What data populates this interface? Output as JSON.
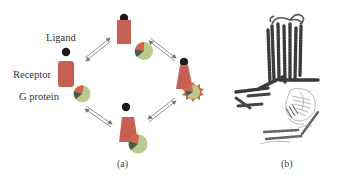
{
  "figure": {
    "panel_a": {
      "caption": "(a)",
      "labels": {
        "ligand": "Ligand",
        "receptor": "Receptor",
        "g_protein": "G protein"
      },
      "states": [
        {
          "id": "inactive",
          "position": "left",
          "receptor_shape": "rounded-rect",
          "g_protein": "separated"
        },
        {
          "id": "ligand-bound",
          "position": "top",
          "receptor_shape": "rect",
          "g_protein": "separated"
        },
        {
          "id": "active-coupled",
          "position": "right",
          "receptor_shape": "trapezoid",
          "g_protein": "coupled-activated"
        },
        {
          "id": "pre-coupled",
          "position": "bottom",
          "receptor_shape": "trapezoid",
          "g_protein": "coupled"
        }
      ],
      "transitions": [
        {
          "from": "inactive",
          "to": "ligand-bound",
          "type": "reversible"
        },
        {
          "from": "ligand-bound",
          "to": "active-coupled",
          "type": "reversible"
        },
        {
          "from": "active-coupled",
          "to": "pre-coupled",
          "type": "reversible"
        },
        {
          "from": "pre-coupled",
          "to": "inactive",
          "type": "reversible"
        }
      ],
      "colors": {
        "ligand": "#1a1a1a",
        "receptor": "#c75f52",
        "g_protein_body": "#b9c98d",
        "g_protein_alpha": "#d2664d",
        "g_protein_core": "#4f5a4a",
        "arrow": "#777777"
      }
    },
    "panel_b": {
      "caption": "(b)",
      "description": "ribbon structure of receptor–G protein complex"
    }
  }
}
